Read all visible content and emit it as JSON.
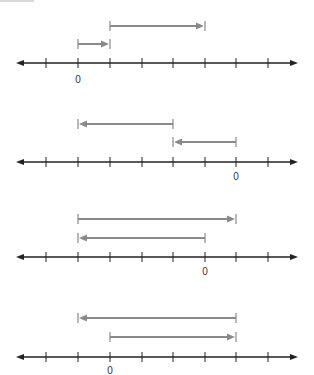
{
  "figure": {
    "colors": {
      "axis": "#222222",
      "arrow": "#8a8a8a",
      "label": "#333333",
      "background": "#ffffff"
    },
    "tick_positions_x": [
      46,
      78,
      110,
      142,
      173,
      205,
      236,
      268
    ],
    "axis_x_start": 16,
    "axis_x_end": 298
  },
  "number_lines": [
    {
      "axis_y": 63,
      "zero_label": "0",
      "zero_tick_index": 1,
      "label_y": 75,
      "arrows": [
        {
          "y": 26,
          "from_tick": 2,
          "to_tick": 5,
          "direction": "right"
        },
        {
          "y": 44,
          "from_tick": 1,
          "to_tick": 2,
          "direction": "right"
        }
      ]
    },
    {
      "axis_y": 162,
      "zero_label": "0",
      "zero_tick_index": 6,
      "label_y": 172,
      "arrows": [
        {
          "y": 124,
          "from_tick": 4,
          "to_tick": 1,
          "direction": "left"
        },
        {
          "y": 142,
          "from_tick": 6,
          "to_tick": 4,
          "direction": "left"
        }
      ]
    },
    {
      "axis_y": 257,
      "zero_label": "0",
      "zero_tick_index": 5,
      "label_y": 267,
      "arrows": [
        {
          "y": 219,
          "from_tick": 1,
          "to_tick": 6,
          "direction": "right"
        },
        {
          "y": 238,
          "from_tick": 5,
          "to_tick": 1,
          "direction": "left"
        }
      ]
    },
    {
      "axis_y": 357,
      "zero_label": "0",
      "zero_tick_index": 2,
      "label_y": 366,
      "arrows": [
        {
          "y": 318,
          "from_tick": 6,
          "to_tick": 1,
          "direction": "left"
        },
        {
          "y": 337,
          "from_tick": 2,
          "to_tick": 6,
          "direction": "right"
        }
      ]
    }
  ]
}
